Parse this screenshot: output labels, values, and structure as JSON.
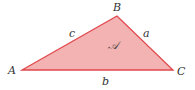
{
  "diagram": {
    "type": "triangle",
    "fill_color": "#f4b3b3",
    "stroke_color": "#e0474c",
    "vertices": [
      {
        "name": "A",
        "x": 22,
        "y": 70
      },
      {
        "name": "B",
        "x": 117,
        "y": 16
      },
      {
        "name": "C",
        "x": 173,
        "y": 70
      }
    ],
    "vertex_labels": {
      "A": "A",
      "B": "B",
      "C": "C"
    },
    "side_labels": {
      "a": "a",
      "b": "b",
      "c": "c"
    },
    "area_label": "𝒜"
  }
}
